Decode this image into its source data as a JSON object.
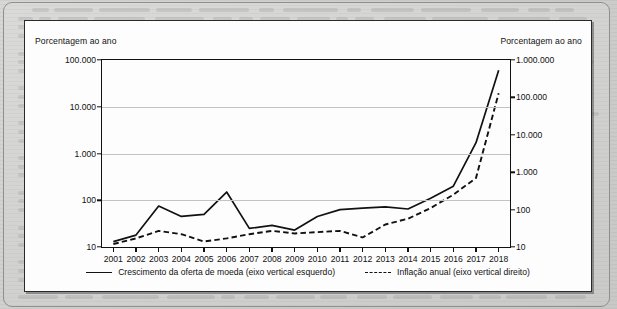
{
  "figure": {
    "left_axis_caption": "Porcentagem ao ano",
    "right_axis_caption": "Porcentagem ao ano"
  },
  "chart_data": {
    "type": "line",
    "title": "",
    "subtitle": "",
    "xlabel": "",
    "ylabel": "Porcentagem ao ano",
    "y2label": "Porcentagem ao ano",
    "yscale": "log",
    "y2scale": "log",
    "ylim": [
      10,
      100000
    ],
    "y2lim": [
      10,
      1000000
    ],
    "yticks": [
      10,
      100,
      1000,
      10000,
      100000
    ],
    "ytick_labels": [
      "10",
      "100",
      "1.000",
      "10.000",
      "100.000"
    ],
    "y2ticks": [
      10,
      100,
      1000,
      10000,
      100000,
      1000000
    ],
    "y2tick_labels": [
      "10",
      "100",
      "1.000",
      "10.000",
      "100.000",
      "1.000.000"
    ],
    "grid": true,
    "grid_axis": "y",
    "legend_position": "bottom",
    "x": [
      2001,
      2002,
      2003,
      2004,
      2005,
      2006,
      2007,
      2008,
      2009,
      2010,
      2011,
      2012,
      2013,
      2014,
      2015,
      2016,
      2017,
      2018
    ],
    "categories": [
      "2001",
      "2002",
      "2003",
      "2004",
      "2005",
      "2006",
      "2007",
      "2008",
      "2009",
      "2010",
      "2011",
      "2012",
      "2013",
      "2014",
      "2015",
      "2016",
      "2017",
      "2018"
    ],
    "series": [
      {
        "name": "Crescimento da oferta de moeda (eixo vertical esquerdo)",
        "axis": "left",
        "style": "solid",
        "color": "#111111",
        "values": [
          13,
          18,
          75,
          45,
          50,
          150,
          25,
          29,
          23,
          45,
          63,
          68,
          72,
          65,
          110,
          200,
          1700,
          60000
        ]
      },
      {
        "name": "Inflação anual (eixo vertical direito)",
        "axis": "right",
        "style": "dashed",
        "color": "#111111",
        "values": [
          12,
          17,
          27,
          22,
          14,
          17,
          22,
          27,
          23,
          25,
          27,
          18,
          40,
          57,
          110,
          250,
          700,
          130000
        ]
      }
    ],
    "legend": [
      "Crescimento da oferta de moeda (eixo vertical esquerdo)",
      "Inflação anual (eixo vertical direito)"
    ]
  }
}
